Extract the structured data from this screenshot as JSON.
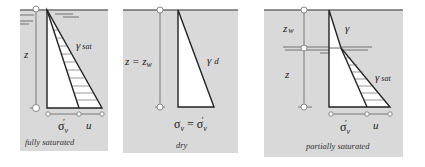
{
  "panels": [
    {
      "id": "fully-saturated",
      "caption": "fully saturated",
      "depth_label": "z",
      "unit_weight_label": "γ",
      "unit_weight_sub": "sat",
      "stress_labels": {
        "effective": "σ",
        "effective_sub": "v",
        "effective_prime": "′",
        "pore": "u"
      }
    },
    {
      "id": "dry",
      "caption": "dry",
      "depth_label": "z = z",
      "depth_sub": "w",
      "unit_weight_label": "γ",
      "unit_weight_sub": "d",
      "stress_labels": {
        "total": "σ",
        "total_sub": "v",
        "equals": " = σ",
        "effective_sub": "v",
        "effective_prime": "′"
      }
    },
    {
      "id": "partially-saturated",
      "caption": "partially saturated",
      "upper_depth_label": "z",
      "upper_depth_sub": "w",
      "lower_depth_label": "z",
      "upper_unit_weight_label": "γ",
      "lower_unit_weight_label": "γ",
      "lower_unit_weight_sub": "sat",
      "stress_labels": {
        "effective": "σ",
        "effective_sub": "v",
        "effective_prime": "′",
        "pore": "u"
      }
    }
  ],
  "colors": {
    "panel_background": "#d9d9d9",
    "line": "#222222",
    "fill": "#ffffff"
  }
}
